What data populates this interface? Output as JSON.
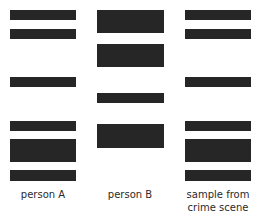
{
  "diagram": {
    "band_color": "#262626",
    "lanes": [
      {
        "id": "person-a",
        "label": "person A",
        "x": 10,
        "width": 66,
        "label_center_x": 43,
        "bands": [
          {
            "y": 10,
            "h": 10
          },
          {
            "y": 29,
            "h": 10
          },
          {
            "y": 77,
            "h": 10
          },
          {
            "y": 121,
            "h": 10
          },
          {
            "y": 139,
            "h": 23
          },
          {
            "y": 170,
            "h": 11
          }
        ]
      },
      {
        "id": "person-b",
        "label": "person B",
        "x": 97,
        "width": 67,
        "label_center_x": 130,
        "bands": [
          {
            "y": 10,
            "h": 23
          },
          {
            "y": 44,
            "h": 23
          },
          {
            "y": 93,
            "h": 10
          },
          {
            "y": 124,
            "h": 24
          }
        ]
      },
      {
        "id": "crime-scene",
        "label": "sample from\ncrime scene",
        "x": 185,
        "width": 66,
        "label_center_x": 218,
        "bands": [
          {
            "y": 10,
            "h": 10
          },
          {
            "y": 29,
            "h": 10
          },
          {
            "y": 77,
            "h": 10
          },
          {
            "y": 121,
            "h": 10
          },
          {
            "y": 139,
            "h": 23
          },
          {
            "y": 170,
            "h": 11
          }
        ]
      }
    ]
  }
}
